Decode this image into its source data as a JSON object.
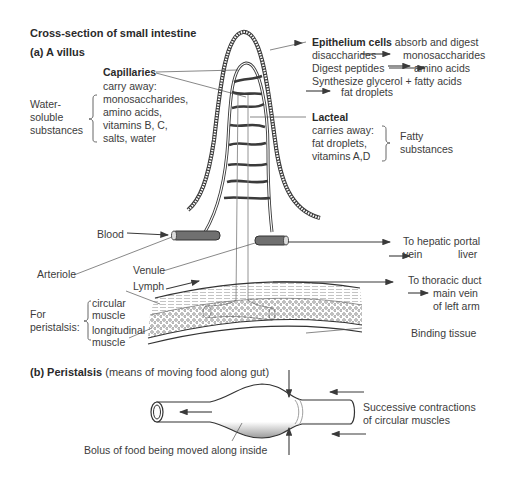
{
  "title": "Cross-section of small intestine",
  "part_a": {
    "heading": "(a) A villus",
    "capillaries": {
      "label": "Capillaries",
      "lines": [
        "carry away:",
        "monosaccharides,",
        "amino acids,",
        "vitamins B, C,",
        "salts, water"
      ],
      "group_label": [
        "Water-",
        "soluble",
        "substances"
      ]
    },
    "epithelium": {
      "label": "Epithelium cells",
      "label_rest": " absorb and digest",
      "line2_a": "disaccharides",
      "line2_b": "monosaccharides",
      "line3_a": "Digest peptides",
      "line3_b": "amino acids",
      "line4": "Synthesize glycerol + fatty acids",
      "line5": "fat droplets"
    },
    "lacteal": {
      "label": "Lacteal",
      "lines": [
        "carries away:",
        "fat droplets,",
        "vitamins A,D"
      ],
      "group_label": [
        "Fatty",
        "substances"
      ]
    },
    "blood": "Blood",
    "arteriole": "Arteriole",
    "venule": "Venule",
    "lymph": "Lymph",
    "hepatic": {
      "line1": "To hepatic portal",
      "line2_a": "vein",
      "line2_b": "liver"
    },
    "thoracic": {
      "line1": "To thoracic duct",
      "line2": "main vein",
      "line3": "of left arm"
    },
    "peristalsis_group": [
      "For",
      "peristalsis:"
    ],
    "circular_muscle": [
      "circular",
      "muscle"
    ],
    "longitudinal_muscle": [
      "longitudinal",
      "muscle"
    ],
    "binding_tissue": "Binding tissue"
  },
  "part_b": {
    "heading_prefix": "(b) ",
    "heading_bold": "Peristalsis",
    "heading_rest": " (means of moving food along gut)",
    "bolus_label": "Bolus of food being moved along inside",
    "contractions_label": [
      "Successive contractions",
      "of circular muscles"
    ]
  },
  "colors": {
    "line": "#3a3a3a",
    "vessel_fill": "#6e6e6e",
    "text": "#3c3c3c"
  }
}
